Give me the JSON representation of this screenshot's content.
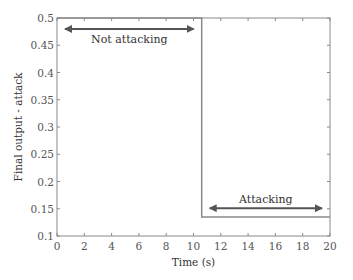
{
  "chart_data": {
    "type": "line",
    "title": "",
    "xlabel": "Time (s)",
    "ylabel": "Final output - attack",
    "xlim": [
      0,
      20
    ],
    "ylim": [
      0.1,
      0.5
    ],
    "xticks": [
      0,
      2,
      4,
      6,
      8,
      10,
      12,
      14,
      16,
      18,
      20
    ],
    "yticks": [
      0.1,
      0.15,
      0.2,
      0.25,
      0.3,
      0.35,
      0.4,
      0.45,
      0.5
    ],
    "xtick_labels": [
      "0",
      "2",
      "4",
      "6",
      "8",
      "10",
      "12",
      "14",
      "16",
      "18",
      "20"
    ],
    "ytick_labels": [
      "0.1",
      "0.15",
      "0.2",
      "0.25",
      "0.3",
      "0.35",
      "0.4",
      "0.45",
      "0.5"
    ],
    "grid": false,
    "legend": null,
    "series": [
      {
        "name": "Final output - attack",
        "x": [
          0,
          10.6,
          10.6,
          20
        ],
        "y": [
          0.5,
          0.5,
          0.135,
          0.135
        ],
        "color": "#8a8a8a"
      }
    ],
    "annotations": [
      {
        "text": "Not attacking",
        "type": "double-arrow",
        "x_start": 0,
        "x_end": 10.6,
        "y": 0.48,
        "label_y": 0.462,
        "color": "#555555"
      },
      {
        "text": "Attacking",
        "type": "double-arrow",
        "x_start": 10.6,
        "x_end": 20,
        "y": 0.151,
        "label_y": 0.167,
        "color": "#555555"
      }
    ]
  }
}
